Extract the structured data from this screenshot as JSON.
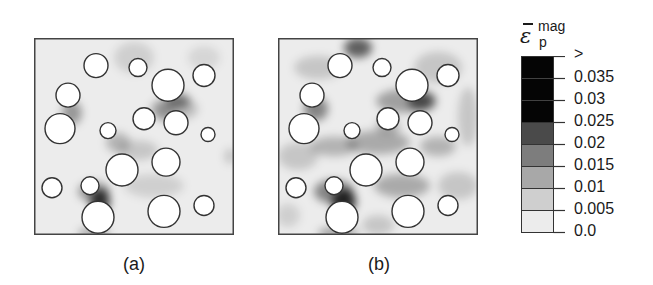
{
  "figure": {
    "panels": [
      {
        "id": "a",
        "caption": "(a)"
      },
      {
        "id": "b",
        "caption": "(b)"
      }
    ],
    "colorbar": {
      "title_symbol": "ε",
      "title_superscript": "mag",
      "title_subscript": "p",
      "tick_labels": [
        ">",
        "0.035",
        "0.03",
        "0.025",
        "0.02",
        "0.015",
        "0.01",
        "0.005",
        "0.0"
      ],
      "colors": [
        "#050505",
        "#050505",
        "#050505",
        "#4a4a4a",
        "#7d7d7d",
        "#a8a8a8",
        "#cfcfcf",
        "#ececec"
      ]
    }
  },
  "chart_data": {
    "type": "heatmap",
    "title": "",
    "colorbar_label": "ε̄_p^mag",
    "colorbar_levels": [
      0.0,
      0.005,
      0.01,
      0.015,
      0.02,
      0.025,
      0.03,
      0.035
    ],
    "colorbar_top_label": ">",
    "panels": [
      {
        "label": "(a)",
        "description": "Plastic strain magnitude field around 17 circular inclusions; mostly low strain (<0.01) with localized peaks near inclusion boundaries",
        "inclusions": [
          {
            "cx": 0.31,
            "cy": 0.14,
            "r": 0.06
          },
          {
            "cx": 0.52,
            "cy": 0.15,
            "r": 0.045
          },
          {
            "cx": 0.67,
            "cy": 0.24,
            "r": 0.08
          },
          {
            "cx": 0.85,
            "cy": 0.19,
            "r": 0.055
          },
          {
            "cx": 0.17,
            "cy": 0.29,
            "r": 0.06
          },
          {
            "cx": 0.13,
            "cy": 0.46,
            "r": 0.075
          },
          {
            "cx": 0.37,
            "cy": 0.47,
            "r": 0.04
          },
          {
            "cx": 0.55,
            "cy": 0.41,
            "r": 0.055
          },
          {
            "cx": 0.71,
            "cy": 0.43,
            "r": 0.06
          },
          {
            "cx": 0.87,
            "cy": 0.49,
            "r": 0.035
          },
          {
            "cx": 0.44,
            "cy": 0.67,
            "r": 0.08
          },
          {
            "cx": 0.66,
            "cy": 0.63,
            "r": 0.07
          },
          {
            "cx": 0.09,
            "cy": 0.76,
            "r": 0.05
          },
          {
            "cx": 0.28,
            "cy": 0.75,
            "r": 0.045
          },
          {
            "cx": 0.32,
            "cy": 0.91,
            "r": 0.08
          },
          {
            "cx": 0.65,
            "cy": 0.88,
            "r": 0.08
          },
          {
            "cx": 0.85,
            "cy": 0.85,
            "r": 0.05
          }
        ],
        "max_strain_region": "between inclusions near bottom-left (x≈0.3, y≈0.83), exceeding 0.035"
      },
      {
        "label": "(b)",
        "description": "Same inclusion layout with more widespread strain bands (0.005-0.02) and peaks near top edge and bottom-left inclusion pair",
        "inclusions": "same as (a)",
        "max_strain_region": "between inclusions near bottom-left and at top edge (x≈0.5, y≈0.05)"
      }
    ]
  }
}
